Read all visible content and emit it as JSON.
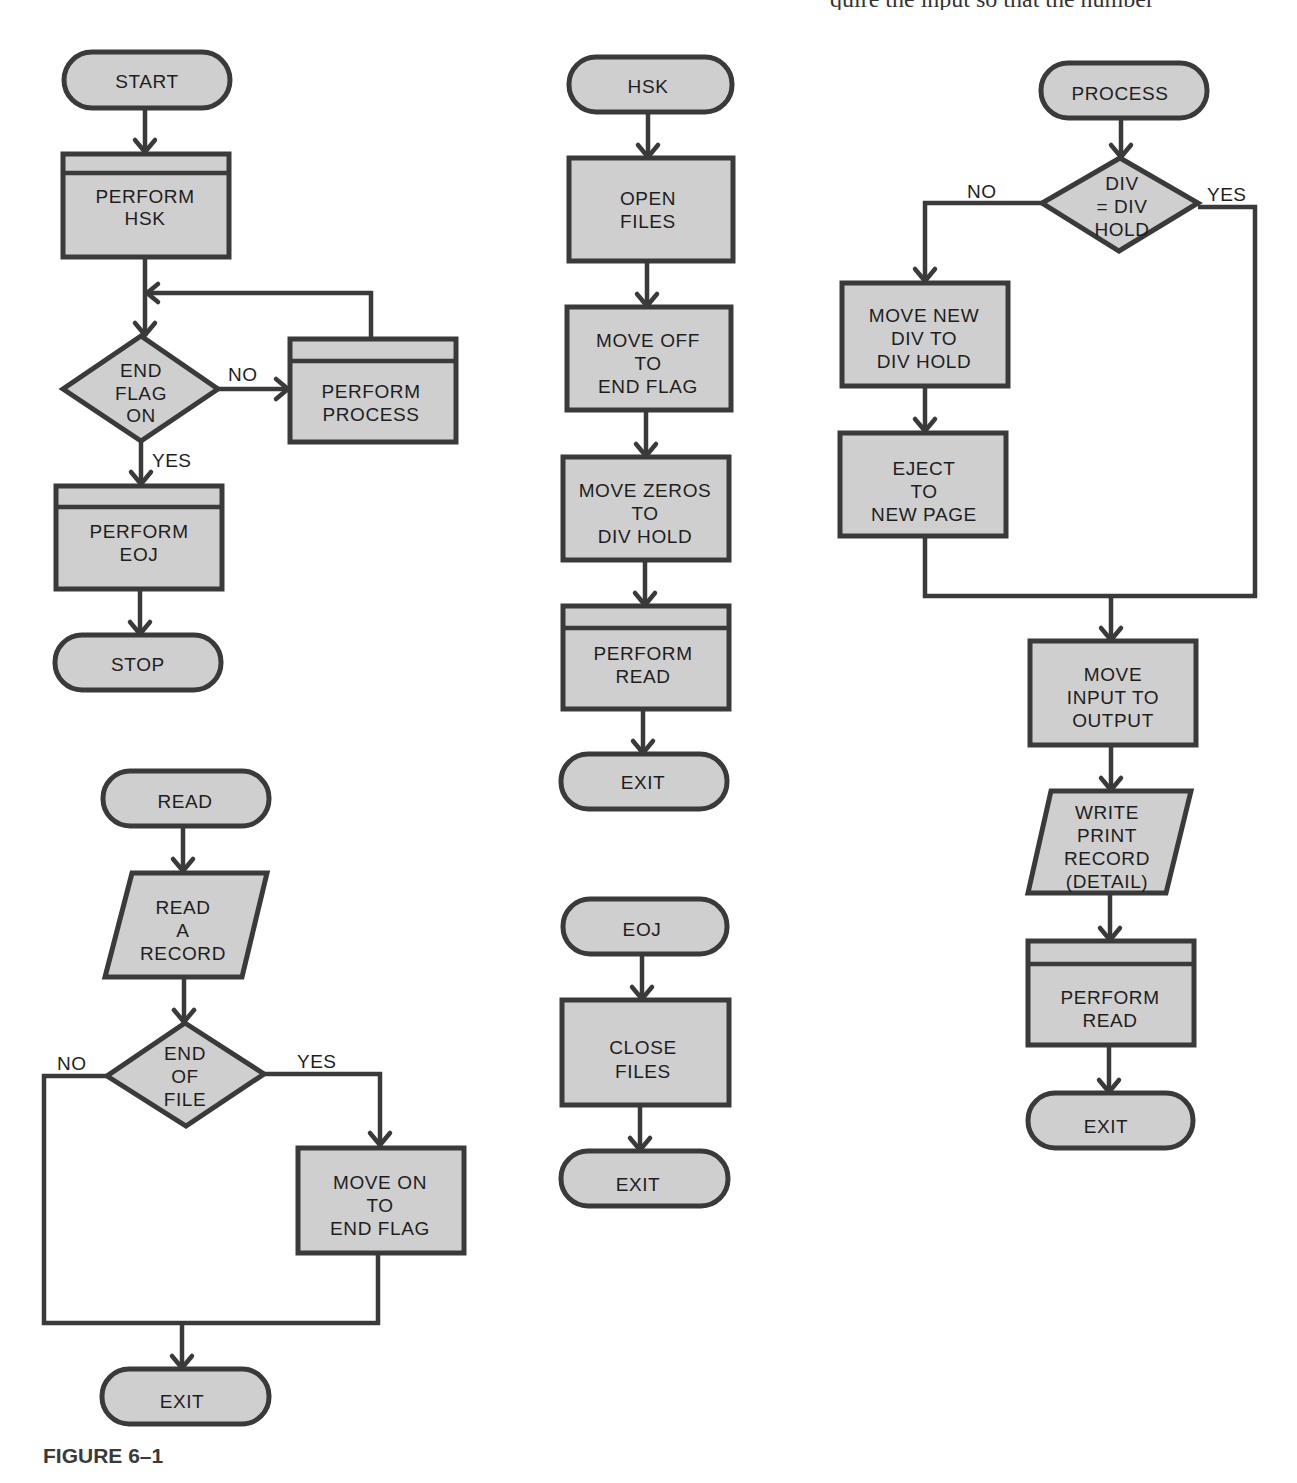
{
  "page": {
    "clipped_top_text": "quire the input so that the number",
    "caption": "FIGURE 6–1"
  },
  "colors": {
    "shape_fill": "#cfcfcf",
    "stroke": "#3a3a3a",
    "text": "#1e1e1e",
    "background": "#ffffff"
  },
  "flowcharts": {
    "main": {
      "start": "START",
      "perform_hsk": [
        "PERFORM",
        "HSK"
      ],
      "decision": [
        "END",
        "FLAG",
        "ON"
      ],
      "no_label": "NO",
      "yes_label": "YES",
      "perform_process": [
        "PERFORM",
        "PROCESS"
      ],
      "perform_eoj": [
        "PERFORM",
        "EOJ"
      ],
      "stop": "STOP"
    },
    "hsk": {
      "start": "HSK",
      "open_files": [
        "OPEN",
        "FILES"
      ],
      "move_off": [
        "MOVE OFF",
        "TO",
        "END FLAG"
      ],
      "move_zeros": [
        "MOVE ZEROS",
        "TO",
        "DIV HOLD"
      ],
      "perform_read": [
        "PERFORM",
        "READ"
      ],
      "exit": "EXIT"
    },
    "process": {
      "start": "PROCESS",
      "decision": [
        "DIV",
        "= DIV",
        "HOLD"
      ],
      "no_label": "NO",
      "yes_label": "YES",
      "move_new_div": [
        "MOVE NEW",
        "DIV TO",
        "DIV HOLD"
      ],
      "eject": [
        "EJECT",
        "TO",
        "NEW PAGE"
      ],
      "move_input": [
        "MOVE",
        "INPUT TO",
        "OUTPUT"
      ],
      "write_print": [
        "WRITE",
        "PRINT",
        "RECORD",
        "(DETAIL)"
      ],
      "perform_read": [
        "PERFORM",
        "READ"
      ],
      "exit": "EXIT"
    },
    "read": {
      "start": "READ",
      "read_record": [
        "READ",
        "A",
        "RECORD"
      ],
      "decision": [
        "END",
        "OF",
        "FILE"
      ],
      "no_label": "NO",
      "yes_label": "YES",
      "move_on": [
        "MOVE ON",
        "TO",
        "END FLAG"
      ],
      "exit": "EXIT"
    },
    "eoj": {
      "start": "EOJ",
      "close_files": [
        "CLOSE",
        "FILES"
      ],
      "exit": "EXIT"
    }
  }
}
